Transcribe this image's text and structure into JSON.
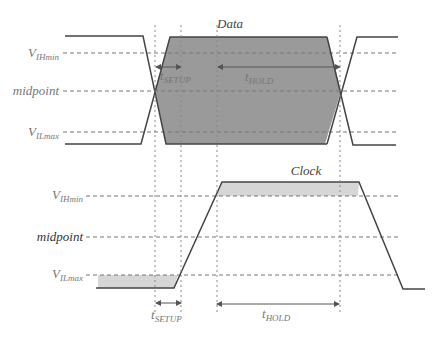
{
  "diagram": {
    "colors": {
      "data_fill": "#9a9a9a",
      "clock_fill": "#d6d6d6",
      "signal_stroke": "#444444"
    },
    "data_panel": {
      "label": "Data",
      "levels": {
        "vih": {
          "main": "V",
          "sub": "IHmin"
        },
        "mid": {
          "main": "midpoint"
        },
        "vil": {
          "main": "V",
          "sub": "ILmax"
        }
      },
      "setup": {
        "main": "t",
        "sub": "SETUP"
      },
      "hold": {
        "main": "t",
        "sub": "HOLD"
      }
    },
    "clock_panel": {
      "label": "Clock",
      "levels": {
        "vih": {
          "main": "V",
          "sub": "IHmin"
        },
        "mid": {
          "main": "midpoint"
        },
        "vil": {
          "main": "V",
          "sub": "ILmax"
        }
      },
      "setup": {
        "main": "t",
        "sub": "SETUP"
      },
      "hold": {
        "main": "t",
        "sub": "HOLD"
      }
    }
  }
}
